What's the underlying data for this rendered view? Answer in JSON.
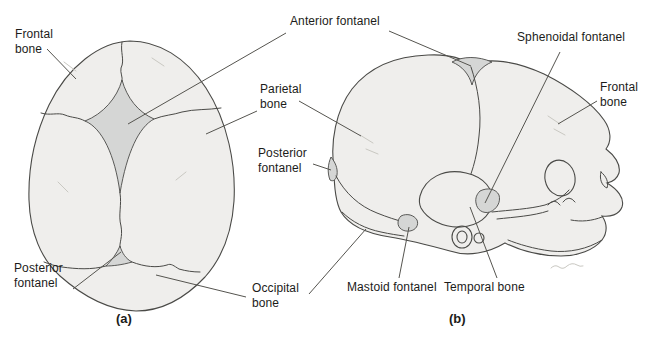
{
  "diagram": {
    "views": {
      "a": {
        "caption": "(a)"
      },
      "b": {
        "caption": "(b)"
      }
    },
    "labels": {
      "frontal_bone_a": "Frontal\nbone",
      "anterior_fontanel": "Anterior fontanel",
      "sphenoidal_fontanel": "Sphenoidal fontanel",
      "parietal_bone": "Parietal\nbone",
      "frontal_bone_b": "Frontal\nbone",
      "posterior_fontanel_b": "Posterior\nfontanel",
      "posterior_fontanel_a": "Posterior\nfontanel",
      "occipital_bone": "Occipital\nbone",
      "mastoid_fontanel": "Mastoid fontanel",
      "temporal_bone": "Temporal bone"
    },
    "colors": {
      "background": "#ffffff",
      "bone_fill": "#efeeec",
      "fontanel_fill": "#d5d6d5",
      "line": "#4a4a47",
      "leader": "#55544f",
      "faint": "#c9c8c2",
      "text": "#1c1c1a"
    }
  }
}
